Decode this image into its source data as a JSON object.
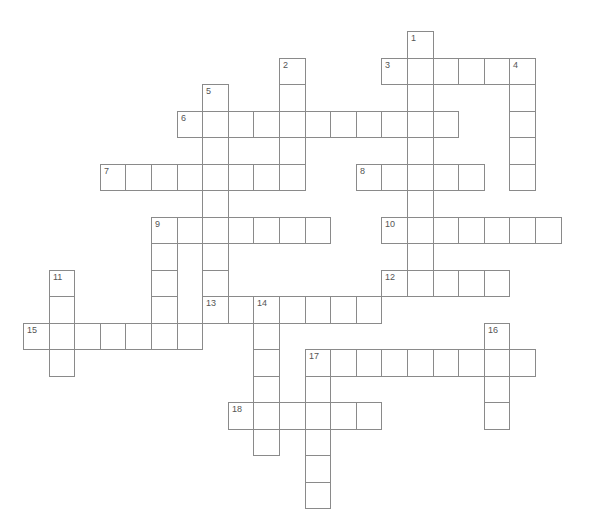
{
  "puzzle": {
    "grid": {
      "origin_x": 23,
      "origin_y": 31,
      "cell_w": 25.6,
      "cell_h": 26.5
    },
    "border_color": "#8a8a8a",
    "number_color": "#555555",
    "entries": [
      {
        "number": "1",
        "direction": "down",
        "row": 0,
        "col": 15,
        "length": 10
      },
      {
        "number": "2",
        "direction": "down",
        "row": 1,
        "col": 10,
        "length": 5
      },
      {
        "number": "3",
        "direction": "across",
        "row": 1,
        "col": 14,
        "length": 6
      },
      {
        "number": "4",
        "direction": "down",
        "row": 1,
        "col": 19,
        "length": 5
      },
      {
        "number": "5",
        "direction": "down",
        "row": 2,
        "col": 7,
        "length": 9
      },
      {
        "number": "6",
        "direction": "across",
        "row": 3,
        "col": 6,
        "length": 11
      },
      {
        "number": "7",
        "direction": "across",
        "row": 5,
        "col": 3,
        "length": 8
      },
      {
        "number": "8",
        "direction": "across",
        "row": 5,
        "col": 13,
        "length": 5
      },
      {
        "number": "9",
        "direction": "across",
        "row": 7,
        "col": 5,
        "length": 7
      },
      {
        "number": "9",
        "direction": "down",
        "row": 7,
        "col": 5,
        "length": 5
      },
      {
        "number": "10",
        "direction": "across",
        "row": 7,
        "col": 14,
        "length": 7
      },
      {
        "number": "11",
        "direction": "down",
        "row": 9,
        "col": 1,
        "length": 4
      },
      {
        "number": "12",
        "direction": "across",
        "row": 9,
        "col": 14,
        "length": 5
      },
      {
        "number": "13",
        "direction": "across",
        "row": 10,
        "col": 7,
        "length": 7
      },
      {
        "number": "14",
        "direction": "down",
        "row": 10,
        "col": 9,
        "length": 6
      },
      {
        "number": "15",
        "direction": "across",
        "row": 11,
        "col": 0,
        "length": 7
      },
      {
        "number": "16",
        "direction": "down",
        "row": 11,
        "col": 18,
        "length": 4
      },
      {
        "number": "17",
        "direction": "across",
        "row": 12,
        "col": 11,
        "length": 9
      },
      {
        "number": "17",
        "direction": "down",
        "row": 12,
        "col": 11,
        "length": 6
      },
      {
        "number": "18",
        "direction": "across",
        "row": 14,
        "col": 8,
        "length": 6
      }
    ]
  }
}
